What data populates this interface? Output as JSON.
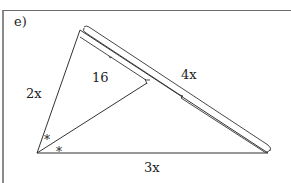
{
  "problem": {
    "label": "e)"
  },
  "triangle": {
    "side_left": "2x",
    "side_bottom": "3x",
    "side_right": "4x",
    "segment": "16",
    "angle_mark_1": "*",
    "angle_mark_2": "*"
  },
  "colors": {
    "line": "#333333",
    "frame": "#7a7a7a",
    "background": "#ffffff"
  }
}
